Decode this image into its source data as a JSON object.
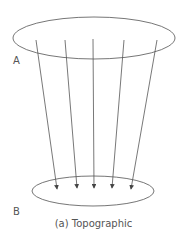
{
  "diagram": {
    "caption": "(a) Topographic",
    "label_a": "A",
    "label_b": "B",
    "stroke_color": "#555555",
    "top_ellipse": {
      "cx": 94,
      "cy": 38,
      "rx": 81,
      "ry": 21
    },
    "bottom_ellipse": {
      "cx": 93,
      "cy": 191,
      "rx": 61,
      "ry": 15
    },
    "arrows": [
      {
        "x1": 36,
        "y1": 40,
        "x2": 57,
        "y2": 192
      },
      {
        "x1": 65,
        "y1": 40,
        "x2": 77,
        "y2": 191
      },
      {
        "x1": 93,
        "y1": 39,
        "x2": 94,
        "y2": 191
      },
      {
        "x1": 124,
        "y1": 40,
        "x2": 112,
        "y2": 191
      },
      {
        "x1": 157,
        "y1": 40,
        "x2": 131,
        "y2": 192
      }
    ]
  }
}
